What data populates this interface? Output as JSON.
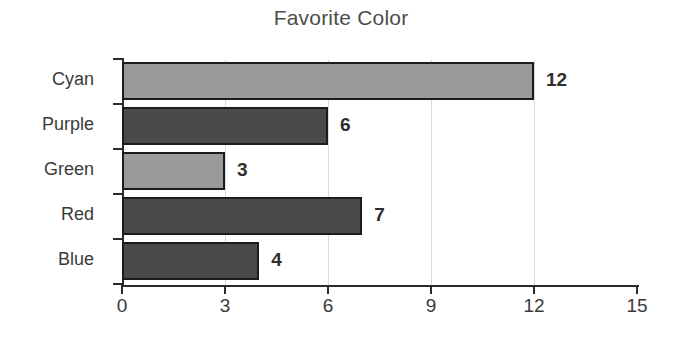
{
  "chart_data": {
    "type": "bar",
    "orientation": "horizontal",
    "title": "Favorite Color",
    "xlabel": "",
    "ylabel": "",
    "categories": [
      "Cyan",
      "Purple",
      "Green",
      "Red",
      "Blue"
    ],
    "values": [
      12,
      6,
      3,
      7,
      4
    ],
    "value_labels": [
      "12",
      "6",
      "3",
      "7",
      "4"
    ],
    "bar_styles": [
      "light",
      "dark",
      "light",
      "dark",
      "dark"
    ],
    "xlim": [
      0,
      15
    ],
    "xticks": [
      0,
      3,
      6,
      9,
      12,
      15
    ],
    "xtick_labels": [
      "0",
      "3",
      "6",
      "9",
      "12",
      "15"
    ],
    "gridlines_x": [
      3,
      6,
      9,
      12
    ],
    "grid": true,
    "legend": null,
    "colors": {
      "bar_light": "#9a9a9a",
      "bar_dark": "#4a4a4a",
      "bar_border": "#1c1c1c",
      "axis": "#2b2b2b",
      "gridline": "#d9d9d9",
      "title_text": "#4d4d4d",
      "label_text": "#3a3a3a",
      "value_text": "#2e2e2e",
      "background": "#ffffff"
    }
  }
}
